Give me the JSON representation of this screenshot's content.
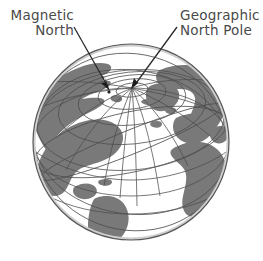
{
  "figure": {
    "name": "earth-magnetic-vs-geographic-north-diagram",
    "background_color": "#ffffff",
    "width": 263,
    "height": 261
  },
  "labels": {
    "magnetic_north": {
      "line1": "Magnetic",
      "line2": "North",
      "color": "#4a4a4a",
      "leader_from": [
        74,
        28
      ],
      "leader_to": [
        110,
        90
      ]
    },
    "geographic_north_pole": {
      "line1": "Geographic",
      "line2": "North Pole",
      "color": "#4a4a4a",
      "leader_from": [
        176,
        28
      ],
      "leader_to": [
        132,
        88
      ]
    }
  },
  "globe": {
    "name": "earth-globe-polar-view",
    "center": [
      131,
      142
    ],
    "radius": 98,
    "ocean_color": "#ffffff",
    "land_color": "#7a7a7a",
    "outline_color": "#555555",
    "graticule_color": "#4d4d4d",
    "pole_point": [
      132,
      88
    ],
    "magnetic_pole_point": [
      110,
      90
    ],
    "projection": "oblique orthographic, north pole tilted toward viewer",
    "features": [
      "Arctic Ocean and polar ice cap near top center",
      "Eurasia / Siberia upper left",
      "Greenland and Canadian Arctic upper right of pole",
      "North America left-center",
      "South America lower left",
      "Europe right of center",
      "Africa lower right",
      "Atlantic Ocean center-bottom"
    ],
    "meridian_count": 12,
    "parallel_count": 6
  }
}
